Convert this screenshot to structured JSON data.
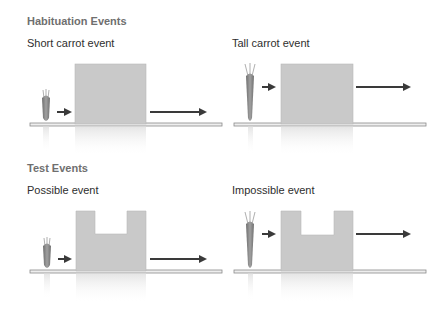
{
  "sections": [
    {
      "title": "Habituation Events",
      "panels": [
        {
          "label": "Short carrot event",
          "carrot": "short",
          "box": "full"
        },
        {
          "label": "Tall carrot event",
          "carrot": "tall",
          "box": "full"
        }
      ]
    },
    {
      "title": "Test Events",
      "panels": [
        {
          "label": "Possible event",
          "carrot": "short",
          "box": "notched"
        },
        {
          "label": "Impossible event",
          "carrot": "tall",
          "box": "notched"
        }
      ]
    }
  ],
  "colors": {
    "box": "#c9c9c9",
    "floor": "#8a8a8a",
    "arrow": "#3a3a3a",
    "carrot": "#8e8e8e",
    "title": "#6f6f6f",
    "label": "#2e2e2e"
  }
}
